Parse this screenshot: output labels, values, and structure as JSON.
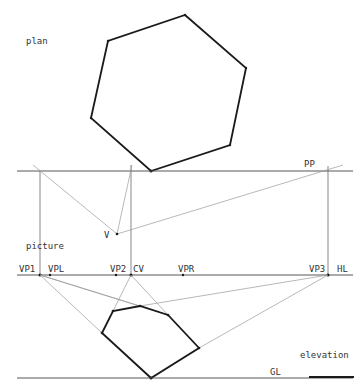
{
  "labels": {
    "plan": "plan",
    "picture": "picture",
    "elevation": "elevation",
    "pp": "PP",
    "hl": "HL",
    "gl": "GL",
    "v": "V",
    "vp1": "VP1",
    "vpl": "VPL",
    "vp2": "VP2",
    "cv": "CV",
    "vpr": "VPR",
    "vp3": "VP3"
  },
  "colors": {
    "bold_line": "#1a1a1a",
    "construction_line": "#9a9a9a",
    "base_line": "#444444",
    "background": "#ffffff"
  }
}
